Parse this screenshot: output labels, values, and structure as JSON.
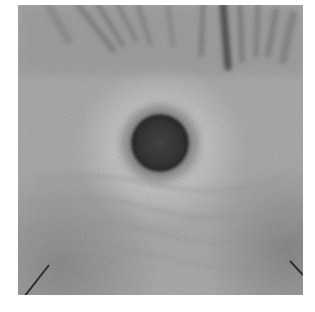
{
  "image": {
    "description": "Grayscale close-up photograph with a dark circular spot at center surrounded by a lighter halo, radial streaks along the top edge, and small dark diagonal marks near the bottom-left and bottom-right corners",
    "palette": {
      "background": "#ffffff",
      "field": "#ababab",
      "halo": "#c4c4c4",
      "spot_core": "#3e3e3e",
      "spot_edge": "#2a2a2a",
      "streaks": "#6e6e6e",
      "corner_marks": "#2e2e2e"
    },
    "features": [
      {
        "name": "central-dark-spot",
        "cx": 160,
        "cy": 143,
        "r": 32
      },
      {
        "name": "top-radial-streaks",
        "region": "top edge"
      },
      {
        "name": "bottom-left-mark",
        "region": "bottom-left corner"
      },
      {
        "name": "bottom-right-mark",
        "region": "bottom-right corner"
      }
    ]
  }
}
